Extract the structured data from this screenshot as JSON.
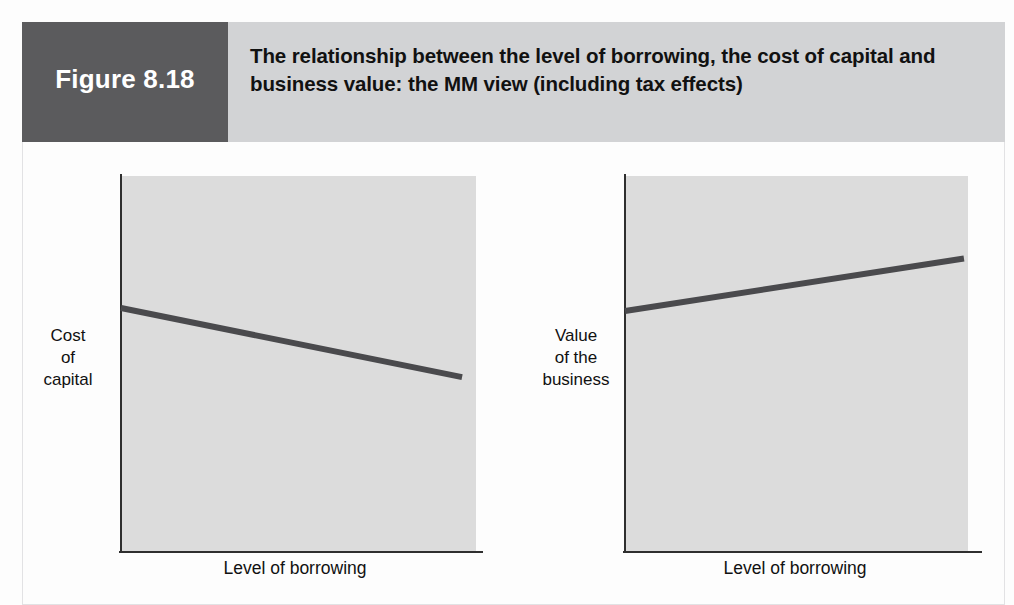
{
  "figure": {
    "number_label": "Figure 8.18",
    "title": "The relationship between the level of borrowing, the cost of capital and business value: the MM view (including tax effects)",
    "header_background": "#d2d3d5",
    "number_box_background": "#5b5b5d",
    "number_text_color": "#ffffff",
    "title_text_color": "#111111"
  },
  "charts": [
    {
      "id": "cost-of-capital",
      "ylabel": "Cost\nof\ncapital",
      "xlabel": "Level of borrowing",
      "plot_background": "#dcdcdc",
      "line_color": "#4a4a4d",
      "axis_color": "#2f2f2f"
    },
    {
      "id": "value-of-business",
      "ylabel": "Value\nof the\nbusiness",
      "xlabel": "Level of borrowing",
      "plot_background": "#dcdcdc",
      "line_color": "#4a4a4d",
      "axis_color": "#2f2f2f"
    }
  ],
  "chart_data": [
    {
      "type": "line",
      "title": "Cost of capital versus level of borrowing (MM with tax)",
      "xlabel": "Level of borrowing",
      "ylabel": "Cost of capital",
      "x": [
        0,
        100
      ],
      "series": [
        {
          "name": "Cost of capital (WACC)",
          "values": [
            66,
            47
          ]
        }
      ],
      "xlim": [
        0,
        100
      ],
      "ylim": [
        0,
        100
      ],
      "grid": false,
      "legend": "none",
      "axis_ticks": false,
      "annotations": [
        "Downward sloping straight line: cost of capital falls steadily as borrowing rises"
      ]
    },
    {
      "type": "line",
      "title": "Value of the business versus level of borrowing (MM with tax)",
      "xlabel": "Level of borrowing",
      "ylabel": "Value of the business",
      "x": [
        0,
        100
      ],
      "series": [
        {
          "name": "Value of the business",
          "values": [
            64,
            78
          ]
        }
      ],
      "xlim": [
        0,
        100
      ],
      "ylim": [
        0,
        100
      ],
      "grid": false,
      "legend": "none",
      "axis_ticks": false,
      "annotations": [
        "Upward sloping straight line: business value rises steadily as borrowing rises"
      ]
    }
  ]
}
